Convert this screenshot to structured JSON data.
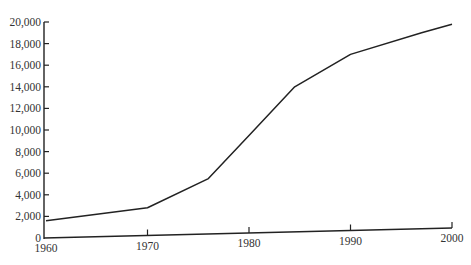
{
  "chart_data": {
    "type": "line",
    "title": "",
    "xlabel": "",
    "ylabel": "",
    "x_ticks": [
      "1960",
      "1970",
      "1980",
      "1990",
      "2000"
    ],
    "y_ticks": [
      "0",
      "2,000",
      "4,000",
      "6,000",
      "8,000",
      "10,000",
      "12,000",
      "14,000",
      "16,000",
      "18,000",
      "20,000"
    ],
    "xlim": [
      1960,
      2000
    ],
    "ylim": [
      0,
      20000
    ],
    "grid": false,
    "legend": null,
    "series": [
      {
        "name": "series-1",
        "x": [
          1960,
          1970,
          1976,
          1980,
          1984.5,
          1990,
          1997,
          2000
        ],
        "values": [
          1600,
          2800,
          5500,
          9500,
          14000,
          17000,
          19000,
          19800
        ]
      }
    ]
  }
}
